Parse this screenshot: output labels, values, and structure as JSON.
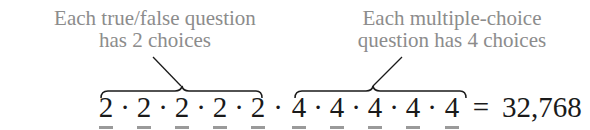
{
  "annotations": {
    "left": {
      "line1": "Each true/false question",
      "line2": "has 2 choices"
    },
    "right": {
      "line1": "Each multiple-choice",
      "line2": "question has 4 choices"
    }
  },
  "equation": {
    "factors": [
      "2",
      "2",
      "2",
      "2",
      "2",
      "4",
      "4",
      "4",
      "4",
      "4"
    ],
    "operator": "·",
    "equals": "=",
    "result": "32,768"
  },
  "groups": [
    {
      "label": "true/false",
      "choices": 2,
      "count": 5
    },
    {
      "label": "multiple-choice",
      "choices": 4,
      "count": 5
    }
  ],
  "colors": {
    "annotation_text": "#8c8c8c",
    "equation_text": "#1a1a1a",
    "underline": "#9a9a9a"
  }
}
